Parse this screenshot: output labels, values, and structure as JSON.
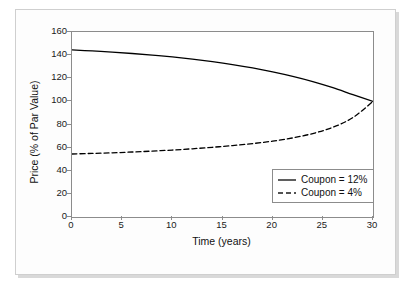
{
  "chart_data": {
    "type": "line",
    "title": "",
    "xlabel": "Time (years)",
    "ylabel": "Price (% of Par Value)",
    "xlim": [
      0,
      30
    ],
    "ylim": [
      0,
      160
    ],
    "xticks": [
      "0",
      "5",
      "10",
      "15",
      "20",
      "25",
      "30"
    ],
    "yticks": [
      "0",
      "20",
      "40",
      "60",
      "80",
      "100",
      "120",
      "140",
      "160"
    ],
    "grid": false,
    "legend_position": "lower right",
    "x": [
      0,
      2,
      4,
      6,
      8,
      10,
      12,
      14,
      16,
      18,
      20,
      22,
      24,
      26,
      28,
      30
    ],
    "series": [
      {
        "name": "Coupon = 12%",
        "style": "solid",
        "color": "#000000",
        "values": [
          144.5,
          143.6,
          142.6,
          141.4,
          140.0,
          138.4,
          136.5,
          134.3,
          131.8,
          128.9,
          125.5,
          121.6,
          117.1,
          111.8,
          105.8,
          100.0
        ]
      },
      {
        "name": "Coupon = 4%",
        "style": "dashed",
        "color": "#000000",
        "values": [
          54.5,
          55.0,
          55.5,
          56.2,
          57.0,
          57.9,
          59.0,
          60.3,
          61.8,
          63.5,
          65.6,
          68.4,
          72.2,
          77.6,
          86.0,
          100.0
        ]
      }
    ]
  },
  "legend": {
    "items": [
      {
        "label": "Coupon = 12%",
        "style": "solid"
      },
      {
        "label": "Coupon = 4%",
        "style": "dashed"
      }
    ]
  }
}
